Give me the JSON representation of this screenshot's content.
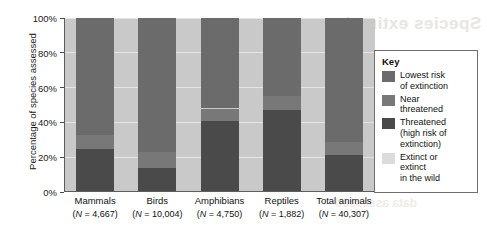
{
  "y_axis": {
    "title": "Percentage of species assessed",
    "ticks": [
      "0%",
      "20%",
      "40%",
      "60%",
      "80%",
      "100%"
    ]
  },
  "legend": {
    "title": "Key",
    "items": [
      {
        "label": "Lowest risk\nof extinction",
        "color": "#6b6b6b"
      },
      {
        "label": "Near\nthreatened",
        "color": "#787878"
      },
      {
        "label": "Threatened\n(high risk of\nextinction)",
        "color": "#4a4a4a"
      },
      {
        "label": "Extinct or\nextinct\nin the wild",
        "color": "#dcdcdc"
      }
    ]
  },
  "categories": [
    {
      "name": "Mammals",
      "n": "(N = 4,667)"
    },
    {
      "name": "Birds",
      "n": "(N = 10,004)"
    },
    {
      "name": "Amphibians",
      "n": "(N = 4,750)"
    },
    {
      "name": "Reptiles",
      "n": "(N = 1,882)"
    },
    {
      "name": "Total animals",
      "n": "(N = 40,307)"
    }
  ],
  "bleed_text": {
    "top": "Species extinction",
    "bottom": "data assessed"
  },
  "chart_data": {
    "type": "bar",
    "stacked": true,
    "title": "",
    "xlabel": "",
    "ylabel": "Percentage of species assessed",
    "ylim": [
      0,
      100
    ],
    "yticks": [
      0,
      20,
      40,
      60,
      80,
      100
    ],
    "grid": true,
    "legend_position": "right",
    "categories": [
      "Mammals",
      "Birds",
      "Amphibians",
      "Reptiles",
      "Total animals"
    ],
    "category_n": [
      "N = 4,667",
      "N = 10,004",
      "N = 4,750",
      "N = 1,882",
      "N = 40,307"
    ],
    "series": [
      {
        "name": "Threatened (high risk of extinction)",
        "color": "#4a4a4a",
        "values": [
          25,
          14,
          41,
          47,
          21
        ]
      },
      {
        "name": "Near threatened",
        "color": "#787878",
        "values": [
          8,
          9,
          7,
          8,
          8
        ]
      },
      {
        "name": "Lowest risk of extinction",
        "color": "#6b6b6b",
        "values": [
          67,
          77,
          52,
          45,
          71
        ]
      },
      {
        "name": "Extinct or extinct in the wild",
        "color": "#dcdcdc",
        "values": [
          0,
          0,
          0,
          0,
          0
        ]
      }
    ]
  }
}
